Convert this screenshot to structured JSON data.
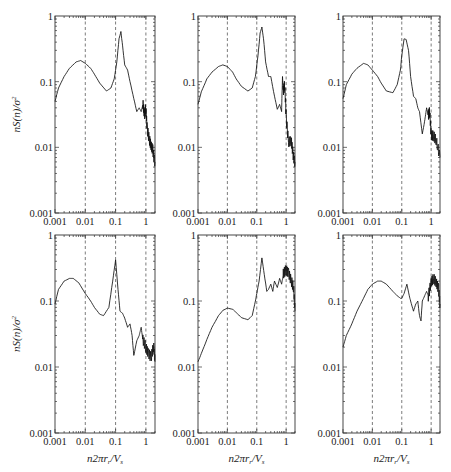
{
  "chart_data": [
    {
      "type": "line",
      "panel": "row1-col1",
      "xscale": "log",
      "yscale": "log",
      "xlim": [
        0.001,
        2
      ],
      "ylim": [
        0.001,
        1
      ],
      "xticks": [
        "0.001",
        "0.01",
        "0.1",
        "1"
      ],
      "yticks": [
        "0.001",
        "0.01",
        "0.1",
        "1"
      ],
      "ylabel": "nS(n)/σ²",
      "xlabel": "",
      "vlines": [
        0.01,
        0.1,
        1
      ],
      "x": [
        0.001,
        0.0013,
        0.002,
        0.003,
        0.005,
        0.007,
        0.01,
        0.015,
        0.02,
        0.03,
        0.05,
        0.07,
        0.09,
        0.11,
        0.13,
        0.15,
        0.17,
        0.2,
        0.25,
        0.3,
        0.4,
        0.5,
        0.6,
        0.7,
        0.8,
        0.9,
        1.0,
        1.1,
        1.3,
        1.5,
        1.7,
        2.0
      ],
      "y": [
        0.05,
        0.08,
        0.12,
        0.16,
        0.2,
        0.21,
        0.19,
        0.16,
        0.13,
        0.095,
        0.072,
        0.08,
        0.11,
        0.2,
        0.45,
        0.58,
        0.35,
        0.18,
        0.15,
        0.1,
        0.055,
        0.035,
        0.04,
        0.035,
        0.045,
        0.03,
        0.04,
        0.02,
        0.013,
        0.01,
        0.009,
        0.006
      ]
    },
    {
      "type": "line",
      "panel": "row1-col2",
      "xscale": "log",
      "yscale": "log",
      "xlim": [
        0.001,
        2
      ],
      "ylim": [
        0.001,
        1
      ],
      "xticks": [
        "0.001",
        "0.01",
        "0.1",
        "1"
      ],
      "yticks": [
        "0.001",
        "0.01",
        "0.1",
        "1"
      ],
      "ylabel": "",
      "xlabel": "",
      "vlines": [
        0.01,
        0.1,
        1
      ],
      "x": [
        0.001,
        0.0013,
        0.002,
        0.003,
        0.005,
        0.007,
        0.01,
        0.015,
        0.02,
        0.03,
        0.05,
        0.07,
        0.09,
        0.11,
        0.13,
        0.15,
        0.17,
        0.2,
        0.25,
        0.3,
        0.4,
        0.5,
        0.6,
        0.7,
        0.75,
        0.8,
        0.9,
        1.0,
        1.2,
        1.5,
        1.7,
        2.0
      ],
      "y": [
        0.045,
        0.07,
        0.11,
        0.14,
        0.17,
        0.18,
        0.17,
        0.14,
        0.11,
        0.085,
        0.072,
        0.08,
        0.12,
        0.25,
        0.55,
        0.68,
        0.45,
        0.2,
        0.12,
        0.12,
        0.06,
        0.038,
        0.045,
        0.035,
        0.12,
        0.07,
        0.09,
        0.03,
        0.012,
        0.012,
        0.008,
        0.006
      ]
    },
    {
      "type": "line",
      "panel": "row1-col3",
      "xscale": "log",
      "yscale": "log",
      "xlim": [
        0.001,
        2
      ],
      "ylim": [
        0.001,
        1
      ],
      "xticks": [
        "0.001",
        "0.01",
        "0.1",
        "1"
      ],
      "yticks": [
        "0.001",
        "0.01",
        "0.1",
        "1"
      ],
      "ylabel": "",
      "xlabel": "",
      "vlines": [
        0.01,
        0.1,
        1
      ],
      "x": [
        0.001,
        0.0013,
        0.002,
        0.003,
        0.005,
        0.007,
        0.01,
        0.015,
        0.02,
        0.03,
        0.05,
        0.07,
        0.09,
        0.1,
        0.12,
        0.14,
        0.17,
        0.2,
        0.25,
        0.3,
        0.35,
        0.4,
        0.5,
        0.6,
        0.7,
        0.8,
        0.9,
        1.0,
        1.2,
        1.5,
        2.0
      ],
      "y": [
        0.055,
        0.09,
        0.13,
        0.16,
        0.19,
        0.18,
        0.15,
        0.12,
        0.095,
        0.072,
        0.068,
        0.09,
        0.15,
        0.25,
        0.45,
        0.44,
        0.3,
        0.12,
        0.06,
        0.055,
        0.04,
        0.035,
        0.016,
        0.025,
        0.04,
        0.03,
        0.035,
        0.016,
        0.015,
        0.012,
        0.007
      ]
    },
    {
      "type": "line",
      "panel": "row2-col1",
      "xscale": "log",
      "yscale": "log",
      "xlim": [
        0.001,
        2
      ],
      "ylim": [
        0.001,
        1
      ],
      "xticks": [
        "0.001",
        "0.01",
        "0.1",
        "1"
      ],
      "yticks": [
        "0.001",
        "0.01",
        "0.1",
        "1"
      ],
      "ylabel": "nS(n)/σ²",
      "xlabel": "n2πr_r/V_s",
      "vlines": [
        0.01,
        0.1,
        1
      ],
      "x": [
        0.001,
        0.0013,
        0.002,
        0.003,
        0.004,
        0.006,
        0.01,
        0.015,
        0.02,
        0.03,
        0.04,
        0.06,
        0.08,
        0.1,
        0.12,
        0.14,
        0.17,
        0.2,
        0.25,
        0.3,
        0.35,
        0.4,
        0.5,
        0.6,
        0.7,
        0.8,
        1.0,
        1.2,
        1.5,
        1.8,
        2.0
      ],
      "y": [
        0.09,
        0.15,
        0.2,
        0.22,
        0.22,
        0.19,
        0.13,
        0.1,
        0.08,
        0.063,
        0.06,
        0.08,
        0.2,
        0.42,
        0.15,
        0.07,
        0.065,
        0.055,
        0.04,
        0.045,
        0.03,
        0.015,
        0.025,
        0.03,
        0.04,
        0.025,
        0.02,
        0.017,
        0.014,
        0.02,
        0.012
      ]
    },
    {
      "type": "line",
      "panel": "row2-col2",
      "xscale": "log",
      "yscale": "log",
      "xlim": [
        0.001,
        2
      ],
      "ylim": [
        0.001,
        1
      ],
      "xticks": [
        "0.001",
        "0.01",
        "0.1",
        "1"
      ],
      "yticks": [
        "0.001",
        "0.01",
        "0.1",
        "1"
      ],
      "ylabel": "",
      "xlabel": "n2πr_r/V_s",
      "vlines": [
        0.01,
        0.1,
        1
      ],
      "x": [
        0.001,
        0.0013,
        0.002,
        0.003,
        0.005,
        0.007,
        0.01,
        0.015,
        0.02,
        0.03,
        0.05,
        0.07,
        0.09,
        0.1,
        0.12,
        0.15,
        0.18,
        0.22,
        0.25,
        0.3,
        0.35,
        0.4,
        0.5,
        0.6,
        0.7,
        0.8,
        1.0,
        1.2,
        1.5,
        1.8,
        2.0
      ],
      "y": [
        0.012,
        0.016,
        0.026,
        0.04,
        0.06,
        0.072,
        0.078,
        0.075,
        0.067,
        0.056,
        0.052,
        0.06,
        0.1,
        0.13,
        0.2,
        0.45,
        0.25,
        0.14,
        0.15,
        0.18,
        0.14,
        0.2,
        0.16,
        0.22,
        0.18,
        0.25,
        0.3,
        0.28,
        0.2,
        0.15,
        0.07
      ]
    },
    {
      "type": "line",
      "panel": "row2-col3",
      "xscale": "log",
      "yscale": "log",
      "xlim": [
        0.001,
        2
      ],
      "ylim": [
        0.001,
        1
      ],
      "xticks": [
        "0.001",
        "0.01",
        "0.1",
        "1"
      ],
      "yticks": [
        "0.001",
        "0.01",
        "0.1",
        "1"
      ],
      "ylabel": "",
      "xlabel": "n2πr_r/V_s",
      "vlines": [
        0.01,
        0.1,
        1
      ],
      "x": [
        0.001,
        0.0013,
        0.002,
        0.003,
        0.005,
        0.007,
        0.01,
        0.015,
        0.02,
        0.03,
        0.05,
        0.07,
        0.09,
        0.1,
        0.12,
        0.15,
        0.18,
        0.2,
        0.25,
        0.3,
        0.35,
        0.4,
        0.45,
        0.5,
        0.6,
        0.7,
        0.8,
        1.0,
        1.2,
        1.5,
        1.8,
        2.0
      ],
      "y": [
        0.02,
        0.03,
        0.045,
        0.07,
        0.11,
        0.15,
        0.18,
        0.2,
        0.2,
        0.18,
        0.14,
        0.12,
        0.11,
        0.11,
        0.13,
        0.18,
        0.12,
        0.1,
        0.07,
        0.09,
        0.1,
        0.06,
        0.05,
        0.1,
        0.12,
        0.14,
        0.12,
        0.2,
        0.22,
        0.18,
        0.15,
        0.09
      ]
    }
  ],
  "labels": {
    "y_axis_title": "nS(n)/σ",
    "y_axis_superscript": "2",
    "x_axis_title_main": "n2πr",
    "x_axis_title_sub1": "r",
    "x_axis_title_mid": "/V",
    "x_axis_title_sub2": "s",
    "tick_1": "1",
    "tick_01": "0.1",
    "tick_001": "0.01",
    "tick_0001": "0.001"
  }
}
